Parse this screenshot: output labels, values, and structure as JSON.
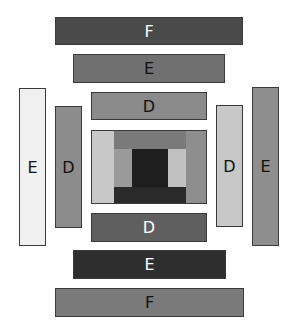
{
  "blocks": {
    "top_f": {
      "label": "F",
      "color": "#4a4a4a",
      "text_color": "#ffffff"
    },
    "top_e": {
      "label": "E",
      "color": "#707070",
      "text_color": "#111111"
    },
    "top_d": {
      "label": "D",
      "color": "#8a8a8a",
      "text_color": "#111111"
    },
    "left_e": {
      "label": "E",
      "color": "#f0f0f0",
      "text_color": "#111111"
    },
    "left_d": {
      "label": "D",
      "color": "#8c8c8c",
      "text_color": "#111111"
    },
    "right_d": {
      "label": "D",
      "color": "#c8c8c8",
      "text_color": "#111111"
    },
    "right_e": {
      "label": "E",
      "color": "#8e8e8e",
      "text_color": "#111111"
    },
    "bottom_d": {
      "label": "D",
      "color": "#5f5f5f",
      "text_color": "#ffffff"
    },
    "bottom_e": {
      "label": "E",
      "color": "#2e2e2e",
      "text_color": "#ffffff"
    },
    "bottom_f": {
      "label": "F",
      "color": "#7a7a7a",
      "text_color": "#111111"
    }
  },
  "center": {
    "left_strip": "#c8c8c8",
    "top_band": "#7a7a7a",
    "right_strip": "#8e8e8e",
    "inner_left": "#9a9a9a",
    "core": "#1e1e1e",
    "inner_right": "#c0c0c0",
    "bottom_band": "#2a2a2a"
  }
}
